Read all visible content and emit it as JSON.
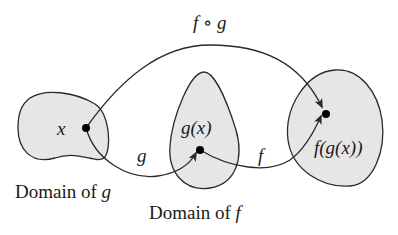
{
  "diagram": {
    "labels": {
      "composition": "f ∘ g",
      "x": "x",
      "gx": "g(x)",
      "fgx": "f(g(x))",
      "g_arrow": "g",
      "f_arrow": "f"
    },
    "captions": {
      "domain_g_prefix": "Domain of ",
      "domain_g_var": "g",
      "domain_f_prefix": "Domain of ",
      "domain_f_var": "f"
    },
    "colors": {
      "region_fill": "#e6e6e6",
      "stroke": "#2a2a2a",
      "point": "#000000"
    }
  }
}
